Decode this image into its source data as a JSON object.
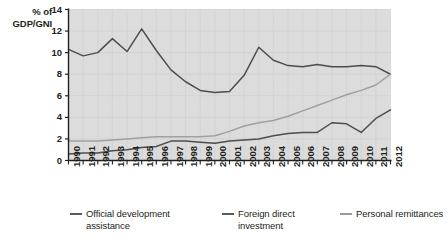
{
  "axis": {
    "ylabel_line1": "% of",
    "ylabel_line2": "GDP/GNI"
  },
  "legend": {
    "items": [
      {
        "label": "Official development\nassistance",
        "color": "#595959"
      },
      {
        "label": "Foreign direct\ninvestment",
        "color": "#595959"
      },
      {
        "label": "Personal remittances",
        "color": "#9a9a9a"
      }
    ]
  },
  "style": {
    "plot_bg": "#dcdcdc",
    "grid": "#cfcfcf",
    "axis": "#231f20",
    "dark_line": "#4d4d4d",
    "mid_line": "#6e6e6e",
    "light_line": "#a0a0a0"
  },
  "chart_data": {
    "type": "line",
    "title": "",
    "xlabel": "",
    "ylabel": "% of GDP/GNI",
    "ylim": [
      0,
      14
    ],
    "yticks": [
      0,
      2,
      4,
      6,
      8,
      10,
      12,
      14
    ],
    "grid": true,
    "legend_position": "bottom",
    "categories": [
      "1990",
      "1991",
      "1992",
      "1993",
      "1994",
      "1995",
      "1996",
      "1997",
      "1998",
      "1999",
      "2000",
      "2001",
      "2002",
      "2003",
      "2004",
      "2005",
      "2006",
      "2007",
      "2008",
      "2009",
      "2010",
      "2011",
      "2012"
    ],
    "series": [
      {
        "name": "Official development assistance",
        "color": "#4d4d4d",
        "values": [
          10.3,
          9.7,
          10.0,
          11.3,
          10.1,
          12.2,
          10.2,
          8.4,
          7.3,
          6.5,
          6.3,
          6.4,
          7.9,
          10.5,
          9.3,
          8.8,
          8.7,
          8.9,
          8.7,
          8.7,
          8.8,
          8.7,
          8.0
        ]
      },
      {
        "name": "Foreign direct investment",
        "color": "#4d4d4d",
        "values": [
          0.6,
          0.7,
          0.7,
          0.9,
          1.0,
          1.2,
          1.3,
          1.8,
          1.8,
          1.7,
          1.6,
          1.8,
          1.9,
          2.0,
          2.3,
          2.5,
          2.6,
          2.6,
          3.5,
          3.4,
          2.6,
          3.9,
          4.7
        ]
      },
      {
        "name": "Personal remittances",
        "color": "#a0a0a0",
        "values": [
          1.8,
          1.8,
          1.8,
          1.9,
          2.0,
          2.1,
          2.2,
          2.2,
          2.2,
          2.2,
          2.3,
          2.7,
          3.2,
          3.5,
          3.7,
          4.1,
          4.6,
          5.1,
          5.6,
          6.1,
          6.5,
          7.0,
          8.0
        ]
      }
    ]
  }
}
